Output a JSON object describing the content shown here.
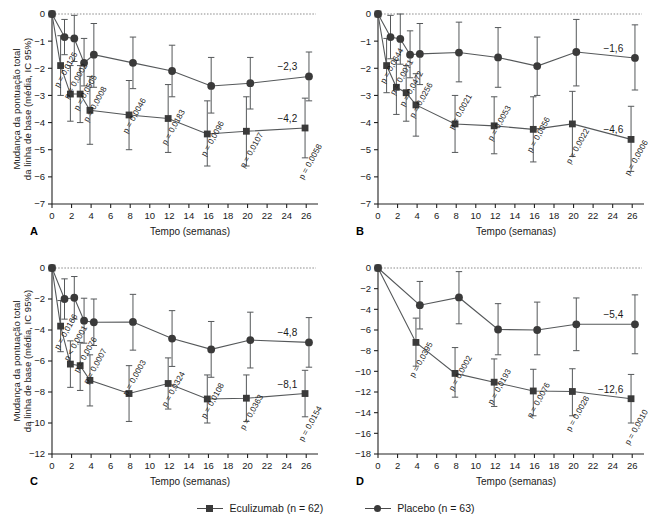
{
  "figure": {
    "axis": {
      "y_title_line1": "Mudança da pontuação total",
      "y_title_line2": "da linha de base (média, IC 95%)",
      "x_title": "Tempo (semanas)",
      "x_ticks": [
        "0",
        "2",
        "4",
        "6",
        "8",
        "10",
        "12",
        "14",
        "16",
        "18",
        "20",
        "22",
        "24",
        "26"
      ],
      "x_tick_values": [
        0,
        2,
        4,
        6,
        8,
        10,
        12,
        14,
        16,
        18,
        20,
        22,
        24,
        26
      ],
      "x_range": [
        0,
        27
      ]
    },
    "legend": [
      {
        "label": "Eculizumab (n = 62)",
        "marker": "square",
        "color": "#3a3a3a"
      },
      {
        "label": "Placebo (n = 63)",
        "marker": "circle",
        "color": "#3a3a3a"
      }
    ]
  },
  "chart_data": [
    {
      "id": "A",
      "type": "line",
      "panel_letter": "A",
      "title": "",
      "xlabel": "Tempo (semanas)",
      "ylabel": "Mudança da pontuação total da linha de base (média, IC 95%)",
      "ylim": [
        -7,
        0
      ],
      "xlim": [
        0,
        27
      ],
      "y_ticks": [
        "0",
        "-1",
        "-2",
        "-3",
        "-4",
        "-5",
        "-6",
        "-7"
      ],
      "y_tick_values": [
        0,
        -1,
        -2,
        -3,
        -4,
        -5,
        -6,
        -7
      ],
      "grid": false,
      "legend_position": "bottom",
      "series": [
        {
          "name": "Eculizumab (n = 62)",
          "marker": "square",
          "x": [
            0,
            1,
            2,
            3,
            4,
            8,
            12,
            16,
            20,
            26
          ],
          "values": [
            0,
            -1.9,
            -2.95,
            -2.95,
            -3.55,
            -3.72,
            -3.85,
            -4.42,
            -4.32,
            -4.2
          ],
          "ci_low": [
            0,
            -3.0,
            -3.95,
            -4.0,
            -4.8,
            -5.0,
            -5.1,
            -5.6,
            -5.6,
            -5.3
          ],
          "ci_high": [
            0,
            -0.8,
            -1.9,
            -1.9,
            -2.3,
            -2.45,
            -2.6,
            -3.2,
            -3.05,
            -3.1
          ]
        },
        {
          "name": "Placebo (n = 63)",
          "marker": "circle",
          "x": [
            0,
            1,
            2,
            3,
            4,
            8,
            12,
            16,
            20,
            26
          ],
          "values": [
            0,
            -0.85,
            -0.9,
            -1.8,
            -1.5,
            -1.8,
            -2.1,
            -2.65,
            -2.55,
            -2.3
          ],
          "ci_low": [
            0,
            -1.5,
            -1.75,
            -2.65,
            -2.7,
            -2.75,
            -3.05,
            -3.65,
            -3.5,
            -3.2
          ],
          "ci_high": [
            0,
            -0.2,
            -0.05,
            -0.9,
            -0.35,
            -0.85,
            -1.15,
            -1.6,
            -1.6,
            -1.4
          ]
        }
      ],
      "pvalues": [
        {
          "x": 1,
          "text": "p = 0,0125"
        },
        {
          "x": 2,
          "text": "p = 0,0002"
        },
        {
          "x": 3,
          "text": "p = 0,0505"
        },
        {
          "x": 4,
          "text": "p = 0,0008"
        },
        {
          "x": 8,
          "text": "p = 0,0046"
        },
        {
          "x": 12,
          "text": "p = 0,0183"
        },
        {
          "x": 16,
          "text": "p = 0,0096"
        },
        {
          "x": 20,
          "text": "p = 0,0107"
        },
        {
          "x": 26,
          "text": "p = 0,0058"
        }
      ],
      "end_labels": [
        {
          "series": "Placebo (n = 63)",
          "text": "-2,3",
          "value": -2.3
        },
        {
          "series": "Eculizumab (n = 62)",
          "text": "-4,2",
          "value": -4.2
        }
      ]
    },
    {
      "id": "B",
      "type": "line",
      "panel_letter": "B",
      "title": "",
      "xlabel": "Tempo (semanas)",
      "ylabel": "",
      "ylim": [
        -7,
        0
      ],
      "xlim": [
        0,
        27
      ],
      "y_ticks": [
        "0",
        "-1",
        "-2",
        "-3",
        "-4",
        "-5",
        "-6",
        "-7"
      ],
      "y_tick_values": [
        0,
        -1,
        -2,
        -3,
        -4,
        -5,
        -6,
        -7
      ],
      "grid": false,
      "legend_position": "bottom",
      "series": [
        {
          "name": "Eculizumab (n = 62)",
          "marker": "square",
          "x": [
            0,
            1,
            2,
            3,
            4,
            8,
            12,
            16,
            20,
            26
          ],
          "values": [
            0,
            -1.9,
            -2.7,
            -2.9,
            -3.35,
            -4.05,
            -4.12,
            -4.25,
            -4.05,
            -4.62
          ],
          "ci_low": [
            0,
            -2.9,
            -3.7,
            -3.95,
            -4.5,
            -5.1,
            -5.15,
            -5.45,
            -5.25,
            -5.8
          ],
          "ci_high": [
            0,
            -0.9,
            -1.7,
            -1.9,
            -2.2,
            -3.0,
            -3.05,
            -3.05,
            -2.85,
            -3.4
          ]
        },
        {
          "name": "Placebo (n = 63)",
          "marker": "circle",
          "x": [
            0,
            1,
            2,
            3,
            4,
            8,
            12,
            16,
            20,
            26
          ],
          "values": [
            0,
            -0.85,
            -0.92,
            -1.5,
            -1.47,
            -1.42,
            -1.6,
            -1.92,
            -1.4,
            -1.62
          ],
          "ci_low": [
            0,
            -1.65,
            -1.85,
            -2.35,
            -2.6,
            -2.5,
            -2.7,
            -3.0,
            -2.65,
            -2.8
          ],
          "ci_high": [
            0,
            -0.05,
            0,
            -0.62,
            -0.35,
            -0.3,
            -0.5,
            -0.85,
            -0.2,
            -0.4
          ]
        }
      ],
      "pvalues": [
        {
          "x": 1,
          "text": "p = 0,0644"
        },
        {
          "x": 2,
          "text": "p = 0,0071"
        },
        {
          "x": 3,
          "text": "p = 0,0472"
        },
        {
          "x": 4,
          "text": "p = 0,0256"
        },
        {
          "x": 8,
          "text": "p = 0,0021"
        },
        {
          "x": 12,
          "text": "p = 0,0053"
        },
        {
          "x": 16,
          "text": "p = 0,0056"
        },
        {
          "x": 20,
          "text": "p = 0,0022"
        },
        {
          "x": 26,
          "text": "p = 0,0006"
        }
      ],
      "end_labels": [
        {
          "series": "Placebo (n = 63)",
          "text": "-1,6",
          "value": -1.6
        },
        {
          "series": "Eculizumab (n = 62)",
          "text": "-4,6",
          "value": -4.6
        }
      ]
    },
    {
      "id": "C",
      "type": "line",
      "panel_letter": "C",
      "title": "",
      "xlabel": "Tempo (semanas)",
      "ylabel": "Mudança da pontuação total da linha de base (média, IC 95%)",
      "ylim": [
        -12,
        0
      ],
      "xlim": [
        0,
        27
      ],
      "y_ticks": [
        "0",
        "-2",
        "-4",
        "-6",
        "-8",
        "-10",
        "-12"
      ],
      "y_tick_values": [
        0,
        -2,
        -4,
        -6,
        -8,
        -10,
        -12
      ],
      "grid": false,
      "legend_position": "bottom",
      "series": [
        {
          "name": "Eculizumab (n = 62)",
          "marker": "square",
          "x": [
            0,
            1,
            2,
            3,
            4,
            8,
            12,
            16,
            20,
            26
          ],
          "values": [
            0,
            -3.75,
            -6.2,
            -6.3,
            -7.25,
            -8.1,
            -7.45,
            -8.45,
            -8.4,
            -8.1
          ],
          "ci_low": [
            0,
            -5.4,
            -7.7,
            -7.9,
            -8.9,
            -9.9,
            -9.1,
            -10.0,
            -9.9,
            -9.6
          ],
          "ci_high": [
            0,
            -2.1,
            -4.7,
            -4.8,
            -5.6,
            -6.3,
            -5.8,
            -6.9,
            -6.9,
            -6.6
          ]
        },
        {
          "name": "Placebo (n = 63)",
          "marker": "circle",
          "x": [
            0,
            1,
            2,
            3,
            4,
            8,
            12,
            16,
            20,
            26
          ],
          "values": [
            0,
            -2.0,
            -1.92,
            -3.4,
            -3.5,
            -3.48,
            -4.55,
            -5.25,
            -4.65,
            -4.8
          ],
          "ci_low": [
            0,
            -3.3,
            -3.3,
            -4.85,
            -5.0,
            -5.3,
            -6.35,
            -7.05,
            -6.45,
            -6.4
          ],
          "ci_high": [
            0,
            -0.7,
            -0.55,
            -1.95,
            -2.0,
            -1.7,
            -2.75,
            -3.45,
            -2.85,
            -3.2
          ]
        }
      ],
      "pvalues": [
        {
          "x": 1,
          "text": "p = 0,0166"
        },
        {
          "x": 2,
          "text": "p < 0,0001"
        },
        {
          "x": 3,
          "text": "p = 0,0076"
        },
        {
          "x": 4,
          "text": "p = 0,0007"
        },
        {
          "x": 8,
          "text": "p = 0,0003"
        },
        {
          "x": 12,
          "text": "p = 0,0324"
        },
        {
          "x": 16,
          "text": "p = 0,0108"
        },
        {
          "x": 20,
          "text": "p = 0,0363"
        },
        {
          "x": 26,
          "text": "p = 0,0154"
        }
      ],
      "end_labels": [
        {
          "series": "Placebo (n = 63)",
          "text": "-4,8",
          "value": -4.8
        },
        {
          "series": "Eculizumab (n = 62)",
          "text": "-8,1",
          "value": -8.1
        }
      ]
    },
    {
      "id": "D",
      "type": "line",
      "panel_letter": "D",
      "title": "",
      "xlabel": "Tempo (semanas)",
      "ylabel": "",
      "ylim": [
        -18,
        0
      ],
      "xlim": [
        0,
        27
      ],
      "y_ticks": [
        "0",
        "-2",
        "-4",
        "-6",
        "-8",
        "-10",
        "-12",
        "-14",
        "-16",
        "-18"
      ],
      "y_tick_values": [
        0,
        -2,
        -4,
        -6,
        -8,
        -10,
        -12,
        -14,
        -16,
        -18
      ],
      "grid": false,
      "legend_position": "bottom",
      "series": [
        {
          "name": "Eculizumab (n = 62)",
          "marker": "square",
          "x": [
            0,
            4,
            8,
            12,
            16,
            20,
            26
          ],
          "values": [
            0,
            -7.2,
            -10.2,
            -11.05,
            -11.9,
            -11.95,
            -12.65
          ],
          "ci_low": [
            0,
            -9.5,
            -12.5,
            -13.4,
            -14.3,
            -14.3,
            -15.0
          ],
          "ci_high": [
            0,
            -4.85,
            -7.7,
            -8.8,
            -9.8,
            -9.75,
            -10.3
          ]
        },
        {
          "name": "Placebo (n = 63)",
          "marker": "circle",
          "x": [
            0,
            4,
            8,
            12,
            16,
            20,
            26
          ],
          "values": [
            0,
            -3.6,
            -2.85,
            -5.95,
            -6.0,
            -5.45,
            -5.45
          ],
          "ci_low": [
            0,
            -5.9,
            -5.4,
            -8.4,
            -8.4,
            -8.0,
            -8.3
          ],
          "ci_high": [
            0,
            -1.3,
            -0.35,
            -3.45,
            -3.3,
            -2.9,
            -2.6
          ]
        }
      ],
      "pvalues": [
        {
          "x": 4,
          "text": "p = 0,0395"
        },
        {
          "x": 8,
          "text": "p = 0,0002"
        },
        {
          "x": 12,
          "text": "p = 0,0193"
        },
        {
          "x": 16,
          "text": "p = 0,0076"
        },
        {
          "x": 20,
          "text": "p = 0,0028"
        },
        {
          "x": 26,
          "text": "p = 0,0010"
        }
      ],
      "end_labels": [
        {
          "series": "Placebo (n = 63)",
          "text": "-5,4",
          "value": -5.4
        },
        {
          "series": "Eculizumab (n = 62)",
          "text": "-12,6",
          "value": -12.6
        }
      ]
    }
  ]
}
